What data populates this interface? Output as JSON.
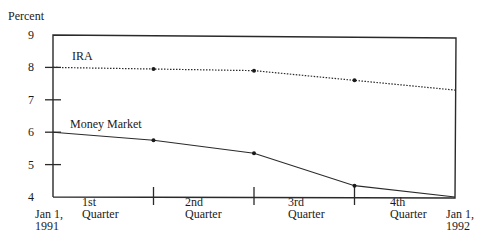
{
  "chart_data": {
    "type": "line",
    "title": "",
    "ylabel": "Percent",
    "xlabel": "",
    "ylim": [
      4,
      9
    ],
    "yticks": [
      4,
      5,
      6,
      7,
      8,
      9
    ],
    "x": [
      "Jan 1, 1991",
      "End Q1",
      "End Q2",
      "End Q3",
      "Jan 1, 1992"
    ],
    "x_start_label": [
      "Jan 1,",
      "1991"
    ],
    "x_end_label": [
      "Jan 1,",
      "1992"
    ],
    "quarter_labels": [
      [
        "1st",
        "Quarter"
      ],
      [
        "2nd",
        "Quarter"
      ],
      [
        "3rd",
        "Quarter"
      ],
      [
        "4th",
        "Quarter"
      ]
    ],
    "series": [
      {
        "name": "IRA",
        "style": "dotted",
        "values": [
          8.0,
          7.95,
          7.9,
          7.6,
          7.3
        ]
      },
      {
        "name": "Money Market",
        "style": "solid",
        "values": [
          6.0,
          5.75,
          5.35,
          4.35,
          4.0
        ]
      }
    ],
    "grid": false,
    "legend": "inline labels above each line"
  }
}
